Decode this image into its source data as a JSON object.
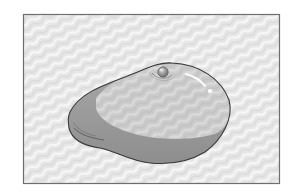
{
  "illustration": {
    "subject": "smooth dome-shaped implant",
    "colors": {
      "page_background": "#ffffff",
      "frame_border": "#6e6e6e",
      "pattern_light": "#f4f4f4",
      "pattern_dark": "#dcdcdc",
      "body_light": "#cfcfcf",
      "body_shadow": "#9a9a9a",
      "outline": "#3a3a3a",
      "highlight": "#ffffff",
      "valve": "#8a8a8a"
    }
  }
}
